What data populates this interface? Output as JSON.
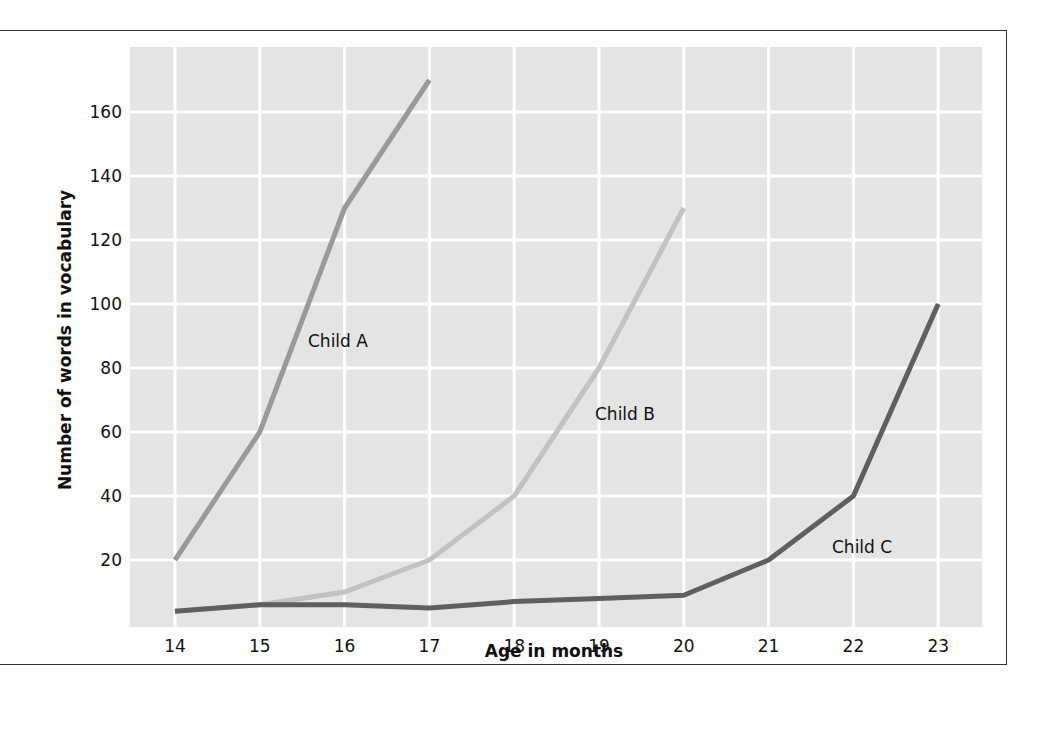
{
  "chart_data": {
    "type": "line",
    "title": "",
    "xlabel": "Age in months",
    "ylabel": "Number of words in vocabulary",
    "x": [
      14,
      15,
      16,
      17,
      18,
      19,
      20,
      21,
      22,
      23
    ],
    "x_tick_labels": [
      "14",
      "15",
      "16",
      "17",
      "18",
      "19",
      "20",
      "21",
      "22",
      "23"
    ],
    "y_tick_labels": [
      "20",
      "40",
      "60",
      "80",
      "100",
      "120",
      "140",
      "160"
    ],
    "y_ticks": [
      20,
      40,
      60,
      80,
      100,
      120,
      140,
      160
    ],
    "ylim": [
      0,
      180
    ],
    "xlim": [
      13.5,
      23.5
    ],
    "grid": true,
    "legend": "inline labels",
    "series": [
      {
        "name": "Child A",
        "label": "Child A",
        "color": "#9a9a9a",
        "x": [
          14,
          15,
          16,
          17
        ],
        "values": [
          20,
          60,
          130,
          170
        ]
      },
      {
        "name": "Child B",
        "label": "Child B",
        "color": "#c2c2c2",
        "x": [
          14,
          15,
          16,
          17,
          18,
          19,
          20
        ],
        "values": [
          4,
          6,
          10,
          20,
          40,
          80,
          130
        ]
      },
      {
        "name": "Child C",
        "label": "Child C",
        "color": "#5f5f5f",
        "x": [
          14,
          15,
          16,
          17,
          18,
          19,
          20,
          21,
          22,
          23
        ],
        "values": [
          4,
          6,
          6,
          5,
          7,
          8,
          9,
          20,
          40,
          100
        ]
      }
    ]
  },
  "colors": {
    "plot_background": "#e4e4e4",
    "gridlines": "#ffffff",
    "frame": "#333333"
  }
}
